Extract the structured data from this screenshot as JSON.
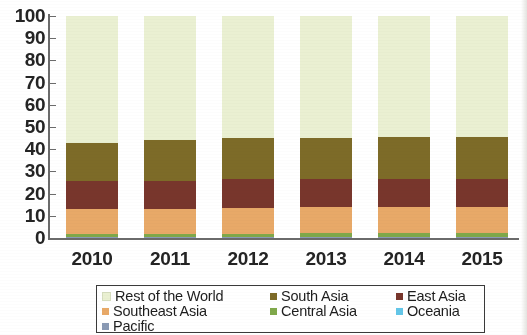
{
  "chart_data": {
    "type": "bar",
    "subtype": "stacked-bar-100-percent",
    "title": "",
    "subtitle": "",
    "xlabel": "",
    "ylabel": "",
    "categories": [
      "2010",
      "2011",
      "2012",
      "2013",
      "2014",
      "2015"
    ],
    "ylim": [
      0,
      100
    ],
    "yticks": [
      0,
      10,
      20,
      30,
      40,
      50,
      60,
      70,
      80,
      90,
      100
    ],
    "grid": false,
    "legend_position": "bottom",
    "stack_order_bottom_to_top": [
      "Pacific",
      "Oceania",
      "Central Asia",
      "Southeast Asia",
      "East Asia",
      "South Asia",
      "Rest of the World"
    ],
    "series": [
      {
        "name": "Pacific",
        "color": "#8a9ab4",
        "values": [
          0.3,
          0.3,
          0.3,
          0.3,
          0.3,
          0.3
        ]
      },
      {
        "name": "Oceania",
        "color": "#63c6e8",
        "values": [
          0.3,
          0.3,
          0.3,
          0.3,
          0.3,
          0.3
        ]
      },
      {
        "name": "Central Asia",
        "color": "#7fa84a",
        "values": [
          1.4,
          1.4,
          1.4,
          1.6,
          1.6,
          1.6
        ]
      },
      {
        "name": "Southeast Asia",
        "color": "#e8a968",
        "values": [
          11.0,
          11.0,
          11.4,
          11.8,
          11.8,
          11.8
        ]
      },
      {
        "name": "East Asia",
        "color": "#78362c",
        "values": [
          12.5,
          12.8,
          13.0,
          12.6,
          12.6,
          12.6
        ]
      },
      {
        "name": "South Asia",
        "color": "#7d6b28",
        "values": [
          17.5,
          18.2,
          18.6,
          18.4,
          18.7,
          18.7
        ]
      },
      {
        "name": "Rest of the World",
        "color": "#eaf0d2",
        "values": [
          57.0,
          56.0,
          55.0,
          55.0,
          54.7,
          54.7
        ]
      }
    ],
    "legend_entries": [
      {
        "label": "Rest of the World",
        "color": "#eaf0d2"
      },
      {
        "label": "South Asia",
        "color": "#7d6b28"
      },
      {
        "label": "East Asia",
        "color": "#78362c"
      },
      {
        "label": "Southeast Asia",
        "color": "#e8a968"
      },
      {
        "label": "Central Asia",
        "color": "#7fa84a"
      },
      {
        "label": "Oceania",
        "color": "#63c6e8"
      },
      {
        "label": "Pacific",
        "color": "#8a9ab4"
      }
    ]
  },
  "axis": {
    "y_tick_labels": [
      "100",
      "90",
      "80",
      "70",
      "60",
      "50",
      "40",
      "30",
      "20",
      "10",
      "0"
    ],
    "x_tick_labels": [
      "2010",
      "2011",
      "2012",
      "2013",
      "2014",
      "2015"
    ]
  },
  "colors": {
    "axis_line": "#6b6b6b",
    "text": "#242424",
    "legend_border": "#3a3a3a",
    "background": "#ffffff"
  }
}
